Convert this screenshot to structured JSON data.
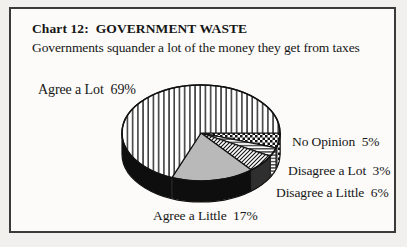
{
  "header": {
    "title": "Chart 12:  GOVERNMENT WASTE",
    "subtitle": "Governments squander a lot of the money they get from taxes"
  },
  "labels": {
    "agree_a_lot": "Agree a Lot  69%",
    "no_opinion": "No Opinion  5%",
    "disagree_a_lot": "Disagree a Lot  3%",
    "disagree_a_little": "Disagree a Little  6%",
    "agree_a_little": "Agree a Little  17%"
  },
  "chart_data": {
    "type": "pie",
    "style": "3d-extruded",
    "title": "Chart 12: GOVERNMENT WASTE",
    "subtitle": "Governments squander a lot of the money they get from taxes",
    "unit": "%",
    "start_angle_deg": 0,
    "direction": "clockwise",
    "legend_position": "around-pie",
    "slices": [
      {
        "label": "No Opinion",
        "value": 5,
        "pattern": "checker"
      },
      {
        "label": "Disagree a Lot",
        "value": 3,
        "pattern": "hlines"
      },
      {
        "label": "Disagree a Little",
        "value": 6,
        "pattern": "diag"
      },
      {
        "label": "Agree a Little",
        "value": 17,
        "pattern": "solid-gray"
      },
      {
        "label": "Agree a Lot",
        "value": 69,
        "pattern": "vlines"
      }
    ],
    "colors": {
      "pattern_ink": "#111111",
      "pattern_bg": "#ffffff",
      "gray_slice": "#b9b9b9",
      "rim": "#0e0e0e",
      "frame_border": "#3a3a3a"
    }
  }
}
